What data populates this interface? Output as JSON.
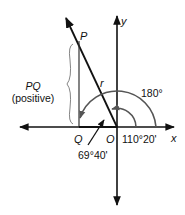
{
  "diagram": {
    "colors": {
      "ink": "#111111",
      "arc": "#555555",
      "brace": "#777777"
    },
    "labels": {
      "P": "P",
      "Q": "Q",
      "O": "O",
      "r": "r",
      "x": "x",
      "y": "y",
      "pq": "PQ",
      "pq_sub": "(positive)",
      "angle_180": "180°",
      "angle_110": "110°20'",
      "angle_69": "69°40'"
    }
  }
}
